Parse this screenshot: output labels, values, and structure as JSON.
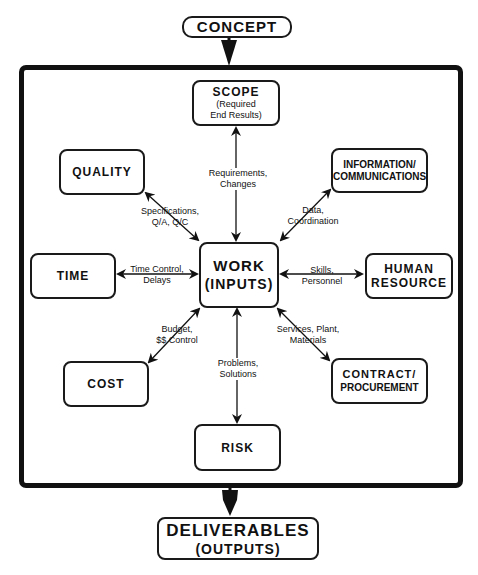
{
  "diagram": {
    "top": {
      "label": "CONCEPT"
    },
    "center": {
      "title": "WORK",
      "subtitle": "(INPUTS)"
    },
    "bottom": {
      "title": "DELIVERABLES",
      "subtitle": "(OUTPUTS)"
    },
    "nodes": {
      "scope": {
        "title": "SCOPE",
        "sub1": "(Required",
        "sub2": "End Results)"
      },
      "quality": {
        "title": "QUALITY"
      },
      "info": {
        "line1": "INFORMATION/",
        "line2": "COMMUNICATIONS"
      },
      "time": {
        "title": "TIME"
      },
      "human": {
        "line1": "HUMAN",
        "line2": "RESOURCE"
      },
      "cost": {
        "title": "COST"
      },
      "contract": {
        "line1": "CONTRACT/",
        "line2": "PROCUREMENT"
      },
      "risk": {
        "title": "RISK"
      }
    },
    "edges": {
      "scope": {
        "line1": "Requirements,",
        "line2": "Changes"
      },
      "quality": {
        "line1": "Specifications,",
        "line2": "Q/A, Q/C"
      },
      "info": {
        "line1": "Data,",
        "line2": "Coordination"
      },
      "time": {
        "line1": "Time Control,",
        "line2": "Delays"
      },
      "human": {
        "line1": "Skills,",
        "line2": "Personnel"
      },
      "cost": {
        "line1": "Budget,",
        "line2": "$$ Control"
      },
      "contract": {
        "line1": "Services, Plant,",
        "line2": "Materials"
      },
      "risk": {
        "line1": "Problems,",
        "line2": "Solutions"
      }
    }
  }
}
